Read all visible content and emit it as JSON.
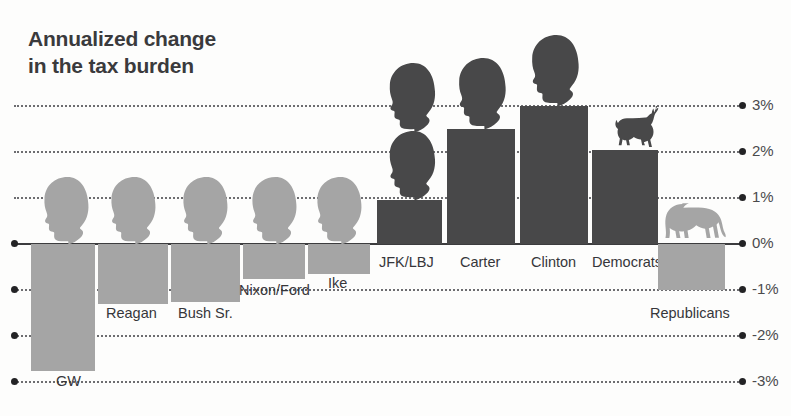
{
  "title": "Annualized change\nin the tax burden",
  "colors": {
    "negative_bar": "#a5a5a5",
    "positive_bar": "#484849",
    "title": "#3a3a3c",
    "gridline": "#6d6d70",
    "zero_line": "#3c3c3e",
    "axis_label": "#4a4a4c"
  },
  "axis": {
    "ticks": [
      {
        "label": "3%",
        "value": 3
      },
      {
        "label": "2%",
        "value": 2
      },
      {
        "label": "1%",
        "value": 1
      },
      {
        "label": "0%",
        "value": 0
      },
      {
        "label": "-1%",
        "value": -1
      },
      {
        "label": "-2%",
        "value": -2
      },
      {
        "label": "-3%",
        "value": -3
      }
    ]
  },
  "chart_data": {
    "type": "bar",
    "title": "Annualized change in the tax burden",
    "xlabel": "",
    "ylabel": "",
    "ylim": [
      -3.2,
      3.3
    ],
    "grid": true,
    "legend": "none",
    "categories": [
      "GW",
      "Reagan",
      "Bush Sr.",
      "Nixon/Ford",
      "Ike",
      "JFK/LBJ",
      "Carter",
      "Clinton",
      "Democrats",
      "Republicans"
    ],
    "values": [
      -2.75,
      -1.3,
      -1.25,
      -0.75,
      -0.65,
      0.95,
      2.5,
      3.0,
      2.05,
      -1.0
    ],
    "value_units": "percent",
    "annotations": [
      "Presidential head silhouettes sit above each presidential bar",
      "A donkey icon marks the Democrats bar",
      "An elephant icon marks the Republicans bar"
    ]
  },
  "bars": [
    {
      "id": "gw",
      "label": "GW",
      "value": -2.75,
      "sign": "neg",
      "x": 31,
      "w": 64,
      "label_x": 56,
      "label_y": 373
    },
    {
      "id": "reagan",
      "label": "Reagan",
      "value": -1.3,
      "sign": "neg",
      "x": 98,
      "w": 70,
      "label_x": 106,
      "label_y": 305
    },
    {
      "id": "bush-sr",
      "label": "Bush Sr.",
      "value": -1.25,
      "sign": "neg",
      "x": 171,
      "w": 69,
      "label_x": 178,
      "label_y": 305
    },
    {
      "id": "nixon-ford",
      "label": "Nixon/Ford",
      "value": -0.75,
      "sign": "neg",
      "x": 243,
      "w": 62,
      "label_x": 239,
      "label_y": 282
    },
    {
      "id": "ike",
      "label": "Ike",
      "value": -0.65,
      "sign": "neg",
      "x": 308,
      "w": 62,
      "label_x": 328,
      "label_y": 275
    },
    {
      "id": "jfk-lbj",
      "label": "JFK/LBJ",
      "value": 0.95,
      "sign": "pos",
      "x": 377,
      "w": 65,
      "label_x": 379,
      "label_y": 254
    },
    {
      "id": "carter",
      "label": "Carter",
      "value": 2.5,
      "sign": "pos",
      "x": 447,
      "w": 68,
      "label_x": 460,
      "label_y": 254
    },
    {
      "id": "clinton",
      "label": "Clinton",
      "value": 3.0,
      "sign": "pos",
      "x": 520,
      "w": 68,
      "label_x": 531,
      "label_y": 254
    },
    {
      "id": "democrats",
      "label": "Democrats",
      "value": 2.05,
      "sign": "pos",
      "x": 592,
      "w": 66,
      "label_x": 592,
      "label_y": 254
    },
    {
      "id": "republicans",
      "label": "Republicans",
      "value": -1.0,
      "sign": "neg",
      "x": 658,
      "w": 67,
      "label_x": 650,
      "label_y": 305
    }
  ],
  "icons": {
    "head_light": "presidential-head-silhouette-light",
    "head_dark": "presidential-head-silhouette-dark",
    "donkey": "donkey-icon",
    "elephant": "elephant-icon"
  }
}
